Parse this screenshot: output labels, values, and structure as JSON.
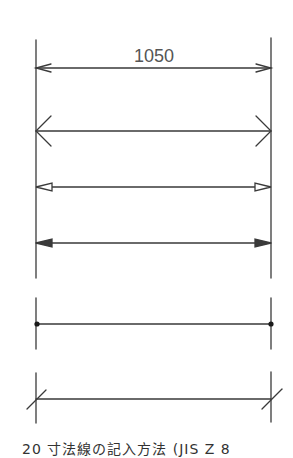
{
  "diagram": {
    "title_value": "1050",
    "caption": "20  寸法線の記入方法 (JIS Z 8",
    "colors": {
      "line": "#3a3a3a",
      "text": "#555555",
      "background": "#ffffff"
    },
    "extension_lines": {
      "left_x": 36,
      "right_x": 271
    },
    "terminators": [
      {
        "name": "open-arrow-narrow",
        "y": 68,
        "label": "1050"
      },
      {
        "name": "open-arrow-90deg",
        "y": 131
      },
      {
        "name": "hollow-triangle-arrow",
        "y": 187
      },
      {
        "name": "filled-triangle-arrow",
        "y": 243
      },
      {
        "name": "dot",
        "y": 324
      },
      {
        "name": "oblique-stroke",
        "y": 399
      }
    ]
  }
}
